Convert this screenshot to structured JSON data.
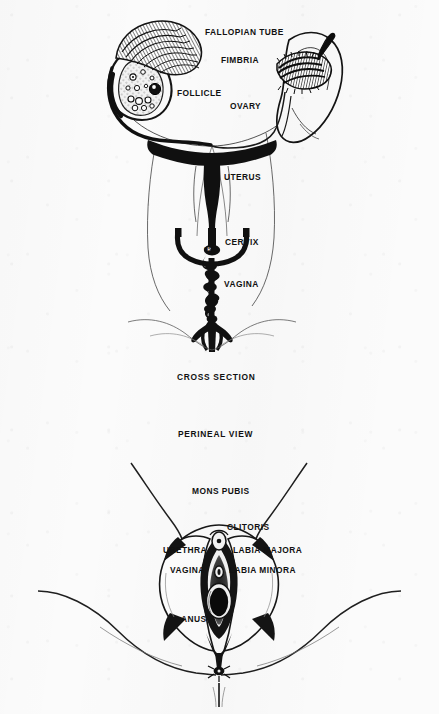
{
  "document": {
    "title": "Female Reproductive Anatomy Diagram",
    "ink_color": "#111111",
    "paper_color": "#fbfbfb"
  },
  "figures": [
    {
      "id": "cross-section",
      "caption": "CROSS SECTION",
      "labels": [
        "FALLOPIAN TUBE",
        "FIMBRIA",
        "FOLLICLE",
        "OVARY",
        "UTERUS",
        "CERVIX",
        "OS",
        "VAGINA"
      ]
    },
    {
      "id": "perineal-view",
      "caption": "PERINEAL VIEW",
      "labels": [
        "MONS PUBIS",
        "CLITORIS",
        "URETHRA",
        "LABIA MAJORA",
        "VAGINA",
        "LABIA MINORA",
        "ANUS"
      ]
    }
  ],
  "cross_section": {
    "caption": "CROSS SECTION",
    "fallopian_tube": "FALLOPIAN TUBE",
    "fimbria": "FIMBRIA",
    "follicle": "FOLLICLE",
    "ovary": "OVARY",
    "uterus": "UTERUS",
    "cervix": "CERVIX",
    "os": "OS",
    "vagina": "VAGINA"
  },
  "perineal_view": {
    "caption": "PERINEAL VIEW",
    "mons_pubis": "MONS PUBIS",
    "clitoris": "CLITORIS",
    "urethra": "URETHRA",
    "labia_majora": "LABIA MAJORA",
    "vagina": "VAGINA",
    "labia_minora": "LABIA MINORA",
    "anus": "ANUS"
  }
}
